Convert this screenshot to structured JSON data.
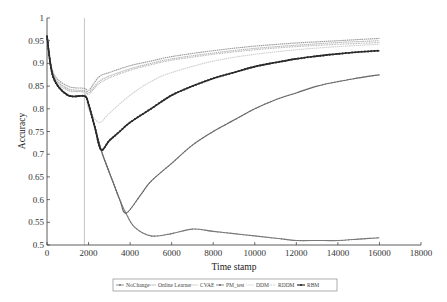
{
  "chart_data": {
    "type": "line",
    "title": "",
    "xlabel": "Time stamp",
    "ylabel": "Accuracy",
    "xlim": [
      0,
      18000
    ],
    "ylim": [
      0.5,
      1
    ],
    "xticks": [
      0,
      2000,
      4000,
      6000,
      8000,
      10000,
      12000,
      14000,
      16000,
      18000
    ],
    "yticks": [
      0.5,
      0.55,
      0.6,
      0.65,
      0.7,
      0.75,
      0.8,
      0.85,
      0.9,
      0.95,
      1
    ],
    "grid": false,
    "legend_position": "bottom-center",
    "annotations": [
      {
        "type": "vertical-line",
        "x": 1800,
        "label": "drift point"
      }
    ],
    "series": [
      {
        "name": "NoChange",
        "color": "#7a7a7a",
        "marker": "plus",
        "x": [
          0,
          300,
          1000,
          1800,
          2000,
          2600,
          3000,
          3500,
          3800,
          4200,
          5000,
          6000,
          7000,
          8000,
          9000,
          10000,
          11000,
          12000,
          13000,
          14000,
          15000,
          16000
        ],
        "values": [
          0.96,
          0.87,
          0.83,
          0.828,
          0.81,
          0.71,
          0.66,
          0.6,
          0.57,
          0.54,
          0.52,
          0.525,
          0.535,
          0.53,
          0.525,
          0.52,
          0.515,
          0.51,
          0.51,
          0.51,
          0.513,
          0.516
        ]
      },
      {
        "name": "Online Learner",
        "color": "#9a9a9a",
        "marker": "dash",
        "x": [
          0,
          300,
          1000,
          1800,
          2000,
          2500,
          3000,
          4000,
          5000,
          6000,
          8000,
          10000,
          12000,
          14000,
          16000
        ],
        "values": [
          0.96,
          0.88,
          0.85,
          0.845,
          0.84,
          0.87,
          0.88,
          0.895,
          0.905,
          0.915,
          0.928,
          0.938,
          0.945,
          0.95,
          0.955
        ]
      },
      {
        "name": "CVAE",
        "color": "#b8b8b8",
        "marker": "dash",
        "x": [
          0,
          300,
          1000,
          1800,
          2000,
          2500,
          3000,
          4000,
          5000,
          6000,
          8000,
          10000,
          12000,
          14000,
          16000
        ],
        "values": [
          0.96,
          0.875,
          0.845,
          0.84,
          0.835,
          0.86,
          0.872,
          0.888,
          0.9,
          0.91,
          0.923,
          0.933,
          0.94,
          0.946,
          0.95
        ]
      },
      {
        "name": "PM_test",
        "color": "#6a6a6a",
        "marker": "plus",
        "x": [
          0,
          300,
          1000,
          1800,
          2000,
          2600,
          3000,
          3500,
          3800,
          4500,
          5000,
          6000,
          7000,
          8000,
          9000,
          10000,
          11000,
          12000,
          13000,
          14000,
          15000,
          16000
        ],
        "values": [
          0.96,
          0.87,
          0.83,
          0.828,
          0.81,
          0.71,
          0.66,
          0.6,
          0.57,
          0.61,
          0.64,
          0.68,
          0.72,
          0.75,
          0.775,
          0.8,
          0.82,
          0.835,
          0.85,
          0.86,
          0.868,
          0.875
        ]
      },
      {
        "name": "DDM",
        "color": "#cfcfcf",
        "marker": "dash",
        "x": [
          0,
          300,
          1000,
          1800,
          2000,
          2500,
          3000,
          4000,
          5000,
          6000,
          8000,
          10000,
          12000,
          14000,
          16000
        ],
        "values": [
          0.96,
          0.87,
          0.84,
          0.835,
          0.8,
          0.77,
          0.79,
          0.83,
          0.86,
          0.88,
          0.905,
          0.92,
          0.93,
          0.937,
          0.942
        ]
      },
      {
        "name": "RDDM",
        "color": "#a8a8a8",
        "marker": "dot",
        "x": [
          0,
          300,
          1000,
          1800,
          2000,
          2500,
          3000,
          4000,
          5000,
          6000,
          8000,
          10000,
          12000,
          14000,
          16000
        ],
        "values": [
          0.96,
          0.875,
          0.842,
          0.838,
          0.832,
          0.855,
          0.868,
          0.885,
          0.897,
          0.907,
          0.92,
          0.93,
          0.937,
          0.942,
          0.946
        ]
      },
      {
        "name": "RBM",
        "color": "#2a2a2a",
        "marker": "diamond",
        "x": [
          0,
          300,
          1000,
          1800,
          2000,
          2300,
          2600,
          3000,
          3500,
          4000,
          5000,
          6000,
          7000,
          8000,
          9000,
          10000,
          11000,
          12000,
          13000,
          14000,
          15000,
          16000
        ],
        "values": [
          0.96,
          0.87,
          0.83,
          0.828,
          0.81,
          0.76,
          0.71,
          0.73,
          0.75,
          0.77,
          0.8,
          0.83,
          0.85,
          0.867,
          0.88,
          0.893,
          0.902,
          0.91,
          0.916,
          0.921,
          0.925,
          0.928
        ]
      }
    ]
  },
  "axes": {
    "xlabel": "Time stamp",
    "ylabel": "Accuracy",
    "xtick_labels": [
      "0",
      "2000",
      "4000",
      "6000",
      "8000",
      "10000",
      "12000",
      "14000",
      "16000",
      "18000"
    ],
    "ytick_labels": [
      "0.5",
      "0.55",
      "0.6",
      "0.65",
      "0.7",
      "0.75",
      "0.8",
      "0.85",
      "0.9",
      "0.95",
      "1"
    ]
  },
  "legend": {
    "items": [
      {
        "label": "NoChange"
      },
      {
        "label": "Online Learner"
      },
      {
        "label": "CVAE"
      },
      {
        "label": "PM_test"
      },
      {
        "label": "DDM"
      },
      {
        "label": "RDDM"
      },
      {
        "label": "RBM"
      }
    ]
  }
}
